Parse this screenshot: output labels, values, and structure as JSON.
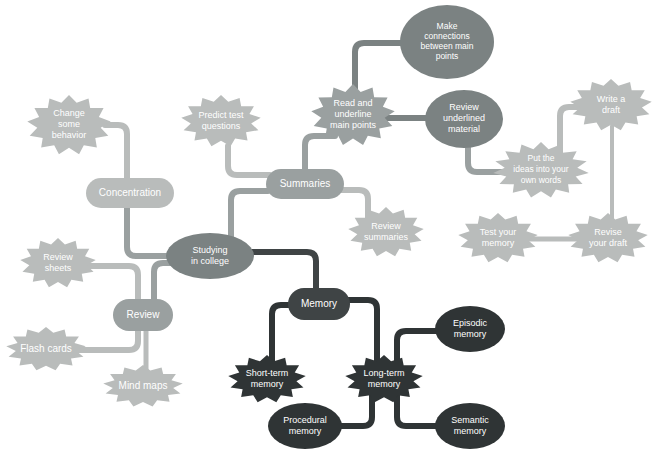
{
  "diagram": {
    "type": "mind-map",
    "background_color": "#ffffff",
    "palette": {
      "light_gray": "#b9bcbb",
      "mid_gray": "#9aa0a0",
      "dark_gray": "#7b8282",
      "charcoal": "#3f4445",
      "near_black": "#2f3435",
      "label_text": "#ffffff"
    }
  },
  "nodes": [
    {
      "id": "studying-in-college",
      "label": "Studying\nin college",
      "lines": [
        "Studying",
        "in college"
      ],
      "shape": "ellipse",
      "color": "#7b8282",
      "x": 210,
      "y": 256,
      "rw": 44,
      "rh": 23
    },
    {
      "id": "concentration",
      "label": "Concentration",
      "lines": [
        "Concentration"
      ],
      "shape": "rounded-rect",
      "color": "#b9bcbb",
      "x": 130,
      "y": 193,
      "rw": 44,
      "rh": 15
    },
    {
      "id": "change-some-behavior",
      "label": "Change some behavior",
      "lines": [
        "Change",
        "some",
        "behavior"
      ],
      "shape": "burst",
      "color": "#b9bcbb",
      "x": 69,
      "y": 125,
      "rw": 42,
      "rh": 30
    },
    {
      "id": "summaries",
      "label": "Summaries",
      "lines": [
        "Summaries"
      ],
      "shape": "rounded-rect",
      "color": "#9aa0a0",
      "x": 305,
      "y": 184,
      "rw": 39,
      "rh": 15
    },
    {
      "id": "predict-test-questions",
      "label": "Predict test questions",
      "lines": [
        "Predict test",
        "questions"
      ],
      "shape": "burst",
      "color": "#b9bcbb",
      "x": 221,
      "y": 121,
      "rw": 40,
      "rh": 26
    },
    {
      "id": "review-summaries",
      "label": "Review summaries",
      "lines": [
        "Review",
        "summaries"
      ],
      "shape": "burst",
      "color": "#b9bcbb",
      "x": 386,
      "y": 232,
      "rw": 38,
      "rh": 25
    },
    {
      "id": "read-and-underline-main-points",
      "label": "Read and underline main points",
      "lines": [
        "Read and",
        "underline",
        "main points"
      ],
      "shape": "burst",
      "color": "#9aa0a0",
      "x": 353,
      "y": 115,
      "rw": 42,
      "rh": 31
    },
    {
      "id": "make-connections-between-main-points",
      "label": "Make connections between main points",
      "lines": [
        "Make",
        "connections",
        "between main",
        "points"
      ],
      "shape": "ellipse",
      "color": "#7b8282",
      "x": 447,
      "y": 42,
      "rw": 47,
      "rh": 37
    },
    {
      "id": "review-underlined-material",
      "label": "Review underlined material",
      "lines": [
        "Review",
        "underlined",
        "material"
      ],
      "shape": "ellipse",
      "color": "#7b8282",
      "x": 464,
      "y": 119,
      "rw": 39,
      "rh": 29
    },
    {
      "id": "put-the-ideas-into-your-own-words",
      "label": "Put the ideas into your own words",
      "lines": [
        "Put the",
        "ideas into your",
        "own words"
      ],
      "shape": "burst",
      "color": "#b9bcbb",
      "x": 541,
      "y": 170,
      "rw": 48,
      "rh": 28
    },
    {
      "id": "write-a-draft",
      "label": "Write a draft",
      "lines": [
        "Write a",
        "draft"
      ],
      "shape": "burst",
      "color": "#b9bcbb",
      "x": 611,
      "y": 105,
      "rw": 41,
      "rh": 26
    },
    {
      "id": "revise-your-draft",
      "label": "Revise your draft",
      "lines": [
        "Revise",
        "your draft"
      ],
      "shape": "burst",
      "color": "#b9bcbb",
      "x": 608,
      "y": 238,
      "rw": 40,
      "rh": 25
    },
    {
      "id": "test-your-memory",
      "label": "Test your memory",
      "lines": [
        "Test your",
        "memory"
      ],
      "shape": "burst",
      "color": "#b9bcbb",
      "x": 498,
      "y": 238,
      "rw": 40,
      "rh": 25
    },
    {
      "id": "review",
      "label": "Review",
      "lines": [
        "Review"
      ],
      "shape": "rounded-rect",
      "color": "#9aa0a0",
      "x": 143,
      "y": 315,
      "rw": 30,
      "rh": 16
    },
    {
      "id": "review-sheets",
      "label": "Review sheets",
      "lines": [
        "Review",
        "sheets"
      ],
      "shape": "burst",
      "color": "#b9bcbb",
      "x": 58,
      "y": 263,
      "rw": 38,
      "rh": 25
    },
    {
      "id": "flash-cards",
      "label": "Flash cards",
      "lines": [
        "Flash cards"
      ],
      "shape": "burst",
      "color": "#b9bcbb",
      "x": 46,
      "y": 349,
      "rw": 40,
      "rh": 22
    },
    {
      "id": "mind-maps",
      "label": "Mind maps",
      "lines": [
        "Mind maps"
      ],
      "shape": "burst",
      "color": "#b9bcbb",
      "x": 143,
      "y": 386,
      "rw": 40,
      "rh": 21
    },
    {
      "id": "memory",
      "label": "Memory",
      "lines": [
        "Memory"
      ],
      "shape": "rounded-rect",
      "color": "#3f4445",
      "x": 319,
      "y": 304,
      "rw": 31,
      "rh": 16
    },
    {
      "id": "short-term-memory",
      "label": "Short-term memory",
      "lines": [
        "Short-term",
        "memory"
      ],
      "shape": "burst",
      "color": "#2f3435",
      "x": 267,
      "y": 379,
      "rw": 39,
      "rh": 24
    },
    {
      "id": "long-term-memory",
      "label": "Long-term memory",
      "lines": [
        "Long-term",
        "memory"
      ],
      "shape": "burst",
      "color": "#2f3435",
      "x": 384,
      "y": 379,
      "rw": 39,
      "rh": 24
    },
    {
      "id": "episodic-memory",
      "label": "Episodic memory",
      "lines": [
        "Episodic",
        "memory"
      ],
      "shape": "ellipse",
      "color": "#2f3435",
      "x": 470,
      "y": 329,
      "rw": 35,
      "rh": 23
    },
    {
      "id": "semantic-memory",
      "label": "Semantic memory",
      "lines": [
        "Semantic",
        "memory"
      ],
      "shape": "ellipse",
      "color": "#2f3435",
      "x": 470,
      "y": 426,
      "rw": 35,
      "rh": 23
    },
    {
      "id": "procedural-memory",
      "label": "Procedural memory",
      "lines": [
        "Procedural",
        "memory"
      ],
      "shape": "ellipse",
      "color": "#2f3435",
      "x": 305,
      "y": 426,
      "rw": 37,
      "rh": 23
    }
  ],
  "edges": [
    {
      "id": "e-change-concentration",
      "from": "change-some-behavior",
      "to": "concentration",
      "color": "#b9bcbb",
      "width": 6,
      "d": "M 105 125 L 118 125 Q 127 125 127 134 L 127 240"
    },
    {
      "id": "e-concentration-studying",
      "from": "concentration",
      "to": "studying-in-college",
      "color": "#9aa0a0",
      "width": 6,
      "d": "M 127 193 L 127 247 Q 127 256 136 256 L 170 256"
    },
    {
      "id": "e-predict-summaries",
      "from": "predict-test-questions",
      "to": "summaries",
      "color": "#b9bcbb",
      "width": 6,
      "d": "M 228 146 L 228 166 Q 228 175 237 175 L 270 175"
    },
    {
      "id": "e-summaries-studying",
      "from": "summaries",
      "to": "studying-in-college",
      "color": "#9aa0a0",
      "width": 6,
      "d": "M 268 191 L 240 191 Q 231 191 231 200 L 231 248"
    },
    {
      "id": "e-summaries-readunderline",
      "from": "summaries",
      "to": "read-and-underline-main-points",
      "color": "#9aa0a0",
      "width": 6,
      "d": "M 305 172 L 305 145 Q 305 136 314 136 L 335 136"
    },
    {
      "id": "e-summaries-reviewsummaries",
      "from": "summaries",
      "to": "review-summaries",
      "color": "#b9bcbb",
      "width": 6,
      "d": "M 336 190 L 359 190 Q 368 190 368 199 L 368 218"
    },
    {
      "id": "e-read-make",
      "from": "read-and-underline-main-points",
      "to": "make-connections-between-main-points",
      "color": "#7b8282",
      "width": 6,
      "d": "M 355 104 L 355 52 Q 355 43 364 43 L 404 43"
    },
    {
      "id": "e-read-reviewunderlined",
      "from": "read-and-underline-main-points",
      "to": "review-underlined-material",
      "color": "#7b8282",
      "width": 6,
      "d": "M 383 118 L 428 118"
    },
    {
      "id": "e-reviewunderlined-put",
      "from": "review-underlined-material",
      "to": "put-the-ideas-into-your-own-words",
      "color": "#9aa0a0",
      "width": 6,
      "d": "M 468 147 L 468 163 Q 468 172 477 172 L 505 172"
    },
    {
      "id": "e-put-write",
      "from": "put-the-ideas-into-your-own-words",
      "to": "write-a-draft",
      "color": "#b9bcbb",
      "width": 6,
      "d": "M 560 155 L 560 116 Q 560 107 569 107 L 592 107"
    },
    {
      "id": "e-write-revise",
      "from": "write-a-draft",
      "to": "revise-your-draft",
      "color": "#b9bcbb",
      "width": 4,
      "d": "M 612 126 L 612 226"
    },
    {
      "id": "e-revise-test",
      "from": "revise-your-draft",
      "to": "test-your-memory",
      "color": "#b9bcbb",
      "width": 5,
      "d": "M 585 239 L 523 239"
    },
    {
      "id": "e-studying-review",
      "from": "studying-in-college",
      "to": "review",
      "color": "#9aa0a0",
      "width": 6,
      "d": "M 176 263 L 163 263 Q 154 263 154 272 L 154 300"
    },
    {
      "id": "e-reviewsheets-review",
      "from": "review-sheets",
      "to": "review",
      "color": "#b9bcbb",
      "width": 6,
      "d": "M 84 266 L 129 266 Q 138 266 138 275 L 138 301"
    },
    {
      "id": "e-flashcards-review",
      "from": "flash-cards",
      "to": "review",
      "color": "#b9bcbb",
      "width": 6,
      "d": "M 76 350 L 129 350 Q 138 350 138 341 L 138 330"
    },
    {
      "id": "e-review-mindmaps",
      "from": "review",
      "to": "mind-maps",
      "color": "#b9bcbb",
      "width": 5,
      "d": "M 146 331 L 146 374"
    },
    {
      "id": "e-studying-memory",
      "from": "studying-in-college",
      "to": "memory",
      "color": "#3f4445",
      "width": 6,
      "d": "M 250 252 L 307 252 Q 316 252 316 261 L 316 289"
    },
    {
      "id": "e-memory-short",
      "from": "memory",
      "to": "short-term-memory",
      "color": "#2f3435",
      "width": 6,
      "d": "M 292 305 L 281 305 Q 272 305 272 314 L 272 364"
    },
    {
      "id": "e-memory-long",
      "from": "memory",
      "to": "long-term-memory",
      "color": "#2f3435",
      "width": 6,
      "d": "M 347 300 L 368 300 Q 377 300 377 309 L 377 364"
    },
    {
      "id": "e-long-episodic",
      "from": "long-term-memory",
      "to": "episodic-memory",
      "color": "#2f3435",
      "width": 6,
      "d": "M 397 370 L 397 340 Q 397 331 406 331 L 438 331"
    },
    {
      "id": "e-long-semantic",
      "from": "long-term-memory",
      "to": "semantic-memory",
      "color": "#2f3435",
      "width": 6,
      "d": "M 397 392 L 397 417 Q 397 426 406 426 L 438 426"
    },
    {
      "id": "e-long-procedural",
      "from": "long-term-memory",
      "to": "procedural-memory",
      "color": "#2f3435",
      "width": 6,
      "d": "M 372 392 L 372 417 Q 372 426 363 426 L 337 426"
    }
  ]
}
